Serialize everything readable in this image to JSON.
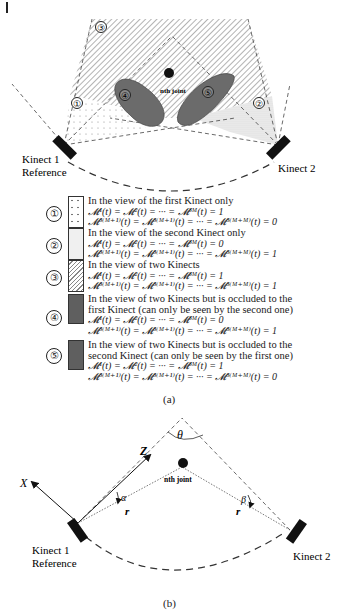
{
  "figure_a": {
    "regions": [
      {
        "id": "1",
        "label": "①"
      },
      {
        "id": "2",
        "label": "②"
      },
      {
        "id": "3",
        "label": "③"
      },
      {
        "id": "4",
        "label": "④"
      },
      {
        "id": "5",
        "label": "⑤"
      }
    ],
    "joint_label": "nth joint",
    "kinect1_label_line1": "Kinect 1",
    "kinect1_label_line2": "Reference",
    "kinect2_label": "Kinect 2",
    "caption": "(a)"
  },
  "legend": [
    {
      "num": "①",
      "swatch": "dotted",
      "description": "In the view of the first Kinect only",
      "eq1": "𝓜¹(t) = 𝓜²(t) = ··· = 𝓜³ᴹ(t) = 1",
      "eq2": "𝓜³⁽ᴹ⁺¹⁾(t) = 𝓜³⁽ᴹ⁺¹⁾(t) = ··· = 𝓜³⁽ᴹ⁺ᴹ⁾(t) = 0"
    },
    {
      "num": "②",
      "swatch": "light",
      "description": "In the view of the second Kinect only",
      "eq1": "𝓜¹(t) = 𝓜²(t) = ··· = 𝓜³ᴹ(t) = 0",
      "eq2": "𝓜³⁽ᴹ⁺¹⁾(t) = 𝓜³⁽ᴹ⁺¹⁾(t) = ··· = 𝓜³⁽ᴹ⁺ᴹ⁾(t) = 1"
    },
    {
      "num": "③",
      "swatch": "hatched",
      "description": "In the view of two Kinects",
      "eq1": "𝓜¹(t) = 𝓜²(t) = ··· = 𝓜³ᴹ(t) = 1",
      "eq2": "𝓜³⁽ᴹ⁺¹⁾(t) = 𝓜³⁽ᴹ⁺¹⁾(t) = ··· = 𝓜³⁽ᴹ⁺ᴹ⁾(t) = 1"
    },
    {
      "num": "④",
      "swatch": "dark",
      "description": "In the view of two Kinects but is occluded to the first Kinect (can only be seen by the second one)",
      "eq1": "𝓜¹(t) = 𝓜²(t) = ··· = 𝓜³ᴹ(t) = 0",
      "eq2": "𝓜³⁽ᴹ⁺¹⁾(t) = 𝓜³⁽ᴹ⁺¹⁾(t) = ··· = 𝓜³⁽ᴹ⁺ᴹ⁾(t) = 1"
    },
    {
      "num": "⑤",
      "swatch": "dark",
      "description": "In the view of two Kinects but is occluded to the second Kinect (can only be seen by the first one)",
      "eq1": "𝓜¹(t) = 𝓜²(t) = ··· = 𝓜³ᴹ(t) = 1",
      "eq2": "𝓜³⁽ᴹ⁺¹⁾(t) = 𝓜³⁽ᴹ⁺¹⁾(t) = ··· = 𝓜³⁽ᴹ⁺ᴹ⁾(t) = 0"
    }
  ],
  "figure_b": {
    "axis_x": "X",
    "axis_z": "Z",
    "theta": "θ",
    "alpha": "α",
    "beta": "β",
    "r_left": "r",
    "r_right": "r",
    "joint_label": "nth joint",
    "kinect1_label_line1": "Kinect 1",
    "kinect1_label_line2": "Reference",
    "kinect2_label": "Kinect 2",
    "caption": "(b)"
  },
  "colors": {
    "occluder": "#6b6b6b",
    "line": "#333333",
    "hatch": "#8a8a8a"
  }
}
